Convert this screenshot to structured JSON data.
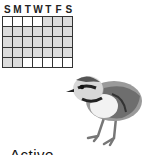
{
  "calendar": {
    "day_headers": [
      "S",
      "M",
      "T",
      "W",
      "T",
      "F",
      "S"
    ],
    "rows": [
      [
        "blank",
        "blank",
        "blank",
        "blank",
        "shade",
        "shade",
        "shade"
      ],
      [
        "shade",
        "shade",
        "shade",
        "shade",
        "shade",
        "shade",
        "shade"
      ],
      [
        "shade",
        "shade",
        "shade",
        "shade",
        "shade",
        "shade",
        "shade"
      ],
      [
        "shade",
        "shade",
        "shade",
        "shade",
        "shade",
        "shade",
        "shade"
      ],
      [
        "shade",
        "shade",
        "blank",
        "blank",
        "blank",
        "blank",
        "blank"
      ]
    ],
    "colors": {
      "shade": "#dcdcdc",
      "blank": "#ffffff",
      "line": "#333333"
    }
  },
  "illustration": {
    "icon": "bird-chick-icon",
    "subject": "plover chick"
  },
  "caption": "Active"
}
